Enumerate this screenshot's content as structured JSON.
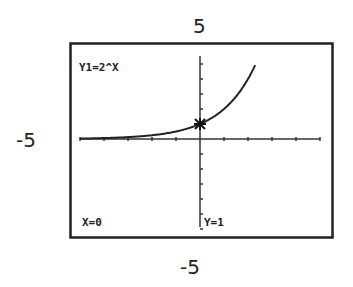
{
  "window_labels": {
    "ymax": "5",
    "xmin": "-5",
    "ymin": "-5"
  },
  "screen": {
    "equation": "Y1=2^X",
    "trace_x": "X=0",
    "trace_y": "Y=1"
  },
  "chart_data": {
    "type": "line",
    "title": "Y1=2^X",
    "function": "2^x",
    "series": [
      {
        "name": "Y1=2^X",
        "x": [
          -5,
          -4,
          -3,
          -2,
          -1,
          0,
          1,
          2,
          2.3
        ],
        "values": [
          0.03125,
          0.0625,
          0.125,
          0.25,
          0.5,
          1,
          2,
          4,
          4.92
        ]
      }
    ],
    "xlim": [
      -5,
      5
    ],
    "ylim": [
      -5,
      5
    ],
    "xlabel": "",
    "ylabel": "",
    "tick_spacing": 1,
    "grid": false,
    "legend": "none",
    "trace_point": {
      "x": 0,
      "y": 1
    },
    "annotations": [
      "X=0",
      "Y=1",
      "5",
      "-5",
      "-5"
    ]
  }
}
